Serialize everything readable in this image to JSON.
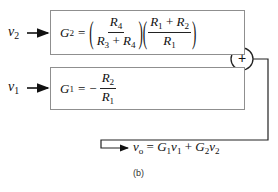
{
  "diagram": {
    "inputs": {
      "v2": {
        "symbol": "v",
        "sub": "2"
      },
      "v1": {
        "symbol": "v",
        "sub": "1"
      }
    },
    "block_top": {
      "lhs": "G",
      "lhs_sub": "2",
      "equals": "=",
      "frac1_num": {
        "sym": "R",
        "sub": "4"
      },
      "frac1_den": {
        "a": "R",
        "a_sub": "3",
        "op": "+",
        "b": "R",
        "b_sub": "4"
      },
      "frac2_num": {
        "a": "R",
        "a_sub": "1",
        "op": "+",
        "b": "R",
        "b_sub": "2"
      },
      "frac2_den": {
        "sym": "R",
        "sub": "1"
      },
      "paren_open": "(",
      "paren_close": ")"
    },
    "block_bottom": {
      "lhs": "G",
      "lhs_sub": "1",
      "equals": "=",
      "minus": "−",
      "frac_num": {
        "sym": "R",
        "sub": "2"
      },
      "frac_den": {
        "sym": "R",
        "sub": "1"
      }
    },
    "summer": {
      "symbol": "+"
    },
    "output": {
      "v": "v",
      "v_sub": "o",
      "eq": "=",
      "t1": "G",
      "t1_sub": "1",
      "t1v": "v",
      "t1v_sub": "1",
      "plus": "+",
      "t2": "G",
      "t2_sub": "2",
      "t2v": "v",
      "t2v_sub": "2"
    },
    "caption": "(b)",
    "colors": {
      "box_border": "#8f8f8f",
      "line": "#222222"
    }
  }
}
